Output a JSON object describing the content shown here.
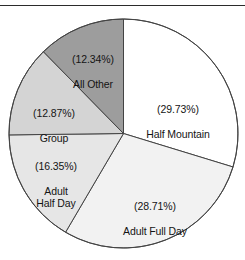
{
  "chart_data": {
    "type": "pie",
    "title": "",
    "subtitle": "",
    "xlabel": "",
    "ylabel": "",
    "legend": "none",
    "grid": false,
    "units": "percent",
    "start_angle_deg": 0,
    "direction": "clockwise",
    "total_pct": "100.00",
    "categories": [
      "Half Mountain",
      "Adult Full Day",
      "Adult Half Day",
      "Group",
      "All Other"
    ],
    "values": [
      29.73,
      28.71,
      16.35,
      12.87,
      12.34
    ],
    "slices": [
      {
        "name": "Half Mountain",
        "label_name": "Half Mountain",
        "pct_text": "(29.73%)",
        "value": 29.73,
        "color": "#ffffff",
        "start_deg": 0,
        "end_deg": 107.0
      },
      {
        "name": "Adult Full Day",
        "label_name": "Adult Full Day",
        "pct_text": "(28.71%)",
        "value": 28.71,
        "color": "#f2f2f2",
        "start_deg": 107.0,
        "end_deg": 210.4
      },
      {
        "name": "Adult Half Day",
        "label_name": "Adult\nHalf Day",
        "pct_text": "(16.35%)",
        "value": 16.35,
        "color": "#e6e6e6",
        "start_deg": 210.4,
        "end_deg": 269.3
      },
      {
        "name": "Group",
        "label_name": "Group",
        "pct_text": "(12.87%)",
        "value": 12.87,
        "color": "#d4d4d4",
        "start_deg": 269.3,
        "end_deg": 315.6
      },
      {
        "name": "All Other",
        "label_name": "All Other",
        "pct_text": "(12.34%)",
        "value": 12.34,
        "color": "#9d9d9d",
        "start_deg": 315.6,
        "end_deg": 360.0
      }
    ],
    "style": {
      "outline_color": "#444444",
      "background": "#ffffff",
      "rule_color": "#2b2b2b"
    }
  }
}
